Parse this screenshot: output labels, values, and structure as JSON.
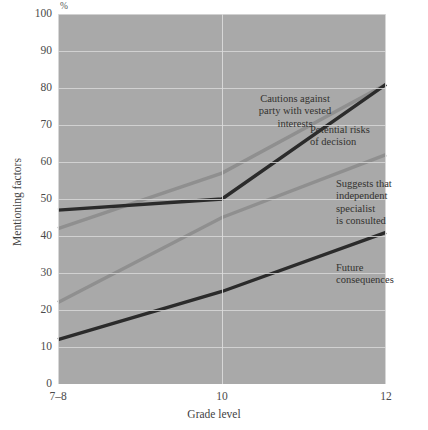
{
  "chart_data": {
    "type": "line",
    "title": "",
    "subtitle": "",
    "xlabel": "Grade level",
    "ylabel": "Mentioning factors",
    "unit_label": "%",
    "categories": [
      "7–8",
      "10",
      "12"
    ],
    "ylim": [
      0,
      100
    ],
    "ytick_step": 10,
    "yticks": [
      100,
      90,
      80,
      70,
      60,
      50,
      40,
      30,
      20,
      10,
      0
    ],
    "grid": true,
    "legend_position": "inline-annotations",
    "plot_background": "#a9a9a9",
    "gridline_color": "#dcdcdc",
    "series": [
      {
        "name": "Cautions against party with vested interests",
        "label": "Cautions against\nparty with vested\ninterests",
        "values": [
          42,
          57,
          81
        ],
        "color": "#8f8f8f"
      },
      {
        "name": "Potential risks of decision",
        "label": "Potential risks\nof decision",
        "values": [
          47,
          50,
          81
        ],
        "color": "#2b2b2b"
      },
      {
        "name": "Suggests that independent specialist is consulted",
        "label": "Suggests that\nindependent\nspecialist\nis consulted",
        "values": [
          22,
          45,
          62
        ],
        "color": "#8f8f8f"
      },
      {
        "name": "Future consequences",
        "label": "Future\nconsequences",
        "values": [
          12,
          25,
          41
        ],
        "color": "#2b2b2b"
      }
    ]
  }
}
